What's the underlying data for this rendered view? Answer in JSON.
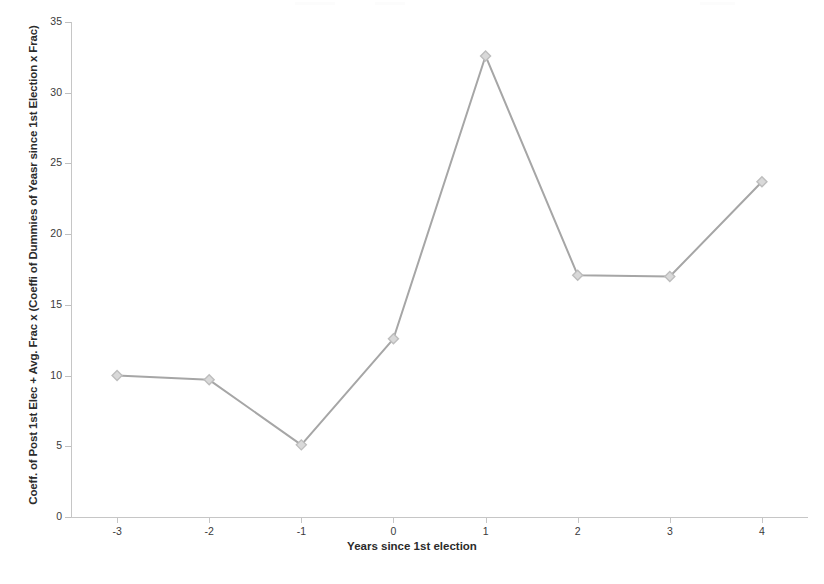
{
  "chart_data": {
    "type": "line",
    "title": "",
    "xlabel": "Years since 1st election",
    "ylabel": "Coeff. of Post 1st Elec + Avg. Frac x (Coeffi of Dummies of Yeasr since 1st Election x Frac)",
    "x": [
      -3,
      -2,
      -1,
      0,
      1,
      2,
      3,
      4
    ],
    "xtick_labels": [
      "-3",
      "-2",
      "-1",
      "0",
      "1",
      "2",
      "3",
      "4"
    ],
    "values": [
      10.0,
      9.7,
      5.1,
      12.6,
      32.6,
      17.1,
      17.0,
      23.7
    ],
    "ylim": [
      0,
      35
    ],
    "yticks": [
      0,
      5,
      10,
      15,
      20,
      25,
      30,
      35
    ],
    "ytick_labels": [
      "0",
      "5",
      "10",
      "15",
      "20",
      "25",
      "30",
      "35"
    ],
    "xlim": [
      -3.5,
      4.5
    ],
    "grid": false,
    "legend": null,
    "series_color": "#a6a6a6",
    "marker": "diamond",
    "marker_color": "#bdbdbd",
    "axis_color": "#c6c6c6",
    "text_color": "#3a3a3a"
  }
}
